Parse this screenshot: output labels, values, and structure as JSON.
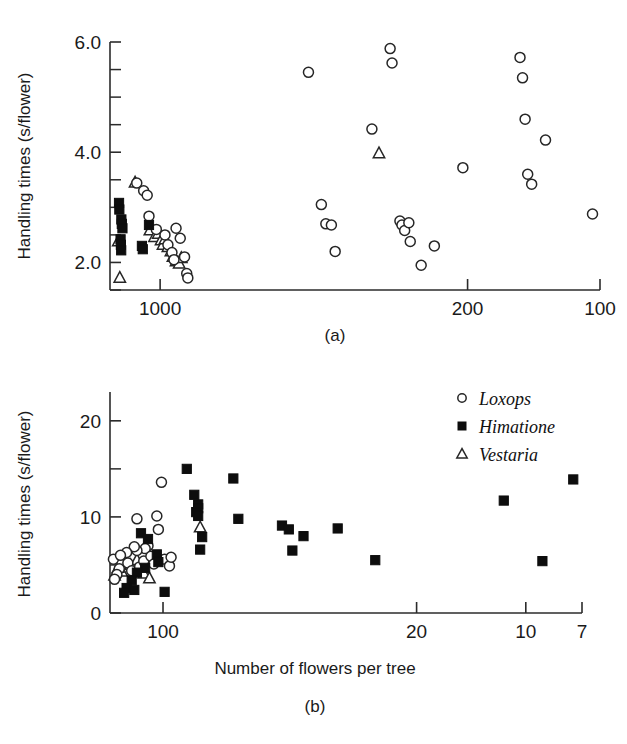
{
  "figure": {
    "caption_a": "(a)",
    "caption_b": "(b)",
    "ylabel": "Handling times (s/flower)",
    "xlabel": "Number of flowers per tree"
  },
  "legend": {
    "position": "top-right of panel (b)",
    "items": [
      {
        "label": "Loxops",
        "marker": "open-circle",
        "color": "#ffffff"
      },
      {
        "label": "Himatione",
        "marker": "filled-square",
        "color": "#0d0d0d"
      },
      {
        "label": "Vestaria",
        "marker": "open-triangle",
        "color": "#ffffff"
      }
    ]
  },
  "chart_data": [
    {
      "type": "scatter",
      "panel": "a",
      "title": "(a)",
      "xlabel": "",
      "ylabel": "Handling times (s/flower)",
      "xscale": "log-reversed",
      "xlim": [
        1300,
        100
      ],
      "ylim": [
        1.5,
        6.0
      ],
      "xticks": [
        1000,
        200,
        100
      ],
      "xticklabels": [
        "1000",
        "200",
        "100"
      ],
      "yticks": [
        2.0,
        4.0,
        6.0
      ],
      "yticklabels": [
        "2.0",
        "4.0",
        "6.0"
      ],
      "yticks_minor": [
        1.5,
        2.5,
        3.0,
        3.5,
        4.5,
        5.0,
        5.5
      ],
      "grid": false,
      "series": [
        {
          "name": "Loxops",
          "marker": "open-circle",
          "points": [
            [
              1130,
              3.44
            ],
            [
              1090,
              3.3
            ],
            [
              1070,
              3.22
            ],
            [
              1060,
              2.84
            ],
            [
              1020,
              2.6
            ],
            [
              975,
              2.5
            ],
            [
              960,
              2.32
            ],
            [
              940,
              2.18
            ],
            [
              930,
              2.05
            ],
            [
              920,
              2.62
            ],
            [
              900,
              2.44
            ],
            [
              880,
              2.1
            ],
            [
              870,
              1.8
            ],
            [
              865,
              1.72
            ],
            [
              460,
              5.45
            ],
            [
              430,
              3.05
            ],
            [
              420,
              2.7
            ],
            [
              408,
              2.68
            ],
            [
              400,
              2.2
            ],
            [
              330,
              4.42
            ],
            [
              300,
              5.88
            ],
            [
              297,
              5.62
            ],
            [
              285,
              2.75
            ],
            [
              282,
              2.68
            ],
            [
              278,
              2.58
            ],
            [
              272,
              2.72
            ],
            [
              270,
              2.38
            ],
            [
              255,
              1.95
            ],
            [
              238,
              2.3
            ],
            [
              205,
              3.72
            ],
            [
              152,
              5.72
            ],
            [
              150,
              5.35
            ],
            [
              148,
              4.6
            ],
            [
              146,
              3.6
            ],
            [
              143,
              3.42
            ],
            [
              133,
              4.22
            ],
            [
              104,
              2.88
            ]
          ]
        },
        {
          "name": "Himatione",
          "marker": "filled-square",
          "points": [
            [
              1240,
              3.08
            ],
            [
              1238,
              2.96
            ],
            [
              1225,
              2.78
            ],
            [
              1222,
              2.7
            ],
            [
              1218,
              2.62
            ],
            [
              1230,
              2.42
            ],
            [
              1228,
              2.32
            ],
            [
              1226,
              2.22
            ],
            [
              1100,
              2.3
            ],
            [
              1095,
              2.24
            ],
            [
              1060,
              2.68
            ]
          ]
        },
        {
          "name": "Vestaria",
          "marker": "open-triangle",
          "points": [
            [
              1140,
              3.45
            ],
            [
              1055,
              2.58
            ],
            [
              1030,
              2.46
            ],
            [
              1010,
              2.52
            ],
            [
              995,
              2.4
            ],
            [
              985,
              2.32
            ],
            [
              975,
              2.42
            ],
            [
              960,
              2.28
            ],
            [
              945,
              2.2
            ],
            [
              935,
              2.1
            ],
            [
              920,
              2.02
            ],
            [
              905,
              1.98
            ],
            [
              895,
              2.08
            ],
            [
              1245,
              2.38
            ],
            [
              1235,
              1.72
            ],
            [
              318,
              3.98
            ]
          ]
        }
      ]
    },
    {
      "type": "scatter",
      "panel": "b",
      "title": "(b)",
      "xlabel": "Number of flowers per tree",
      "ylabel": "Handling times (s/flower)",
      "xscale": "log-reversed",
      "xlim": [
        140,
        7
      ],
      "ylim": [
        0,
        23
      ],
      "xticks": [
        100,
        20,
        10,
        7
      ],
      "xticklabels": [
        "100",
        "20",
        "10",
        "7"
      ],
      "yticks": [
        0,
        10,
        20
      ],
      "yticklabels": [
        "0",
        "10",
        "20"
      ],
      "yticks_minor": [
        5,
        15
      ],
      "grid": false,
      "series": [
        {
          "name": "Loxops",
          "marker": "open-circle",
          "points": [
            [
              118,
              9.8
            ],
            [
              104,
              10.1
            ],
            [
              101,
              13.6
            ],
            [
              103,
              8.7
            ],
            [
              110,
              7.0
            ],
            [
              112,
              6.7
            ],
            [
              118,
              6.5
            ],
            [
              120,
              6.9
            ],
            [
              126,
              6.3
            ],
            [
              130,
              5.3
            ],
            [
              132,
              4.6
            ],
            [
              134,
              4.0
            ],
            [
              136,
              3.5
            ],
            [
              137,
              5.6
            ],
            [
              131,
              6.0
            ],
            [
              125,
              5.2
            ],
            [
              122,
              4.4
            ],
            [
              116,
              4.8
            ],
            [
              113,
              5.4
            ],
            [
              108,
              5.9
            ],
            [
              106,
              5.1
            ],
            [
              99,
              5.6
            ],
            [
              96,
              4.9
            ],
            [
              95,
              5.8
            ]
          ]
        },
        {
          "name": "Himatione",
          "marker": "filled-square",
          "points": [
            [
              86,
              15.0
            ],
            [
              82,
              12.3
            ],
            [
              80,
              11.3
            ],
            [
              80,
              10.9
            ],
            [
              81,
              10.5
            ],
            [
              80,
              10.1
            ],
            [
              78,
              7.9
            ],
            [
              79,
              6.6
            ],
            [
              115,
              8.3
            ],
            [
              110,
              7.7
            ],
            [
              104,
              6.1
            ],
            [
              103,
              5.3
            ],
            [
              112,
              4.7
            ],
            [
              118,
              4.2
            ],
            [
              122,
              3.4
            ],
            [
              126,
              2.6
            ],
            [
              128,
              2.1
            ],
            [
              120,
              2.4
            ],
            [
              99,
              2.2
            ],
            [
              64,
              14.0
            ],
            [
              62,
              9.8
            ],
            [
              47,
              9.1
            ],
            [
              45,
              8.7
            ],
            [
              44,
              6.5
            ],
            [
              41,
              8.0
            ],
            [
              33,
              8.8
            ],
            [
              26,
              5.5
            ],
            [
              11.5,
              11.7
            ],
            [
              9.0,
              5.4
            ],
            [
              7.4,
              13.9
            ]
          ]
        },
        {
          "name": "Vestaria",
          "marker": "open-triangle",
          "points": [
            [
              79,
              8.9
            ],
            [
              127,
              5.3
            ],
            [
              130,
              4.3
            ],
            [
              133,
              4.7
            ],
            [
              136,
              3.9
            ],
            [
              123,
              5.0
            ],
            [
              118,
              5.5
            ],
            [
              113,
              4.1
            ],
            [
              109,
              3.6
            ]
          ]
        }
      ]
    }
  ]
}
